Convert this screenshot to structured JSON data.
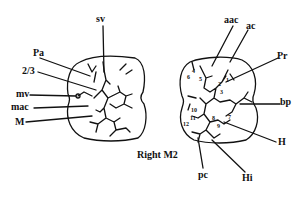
{
  "caption": "Right M2",
  "left_tooth": {
    "labels": {
      "sv": "sv",
      "Pa": "Pa",
      "two_thirds": "2/3",
      "mv": "mv",
      "mac": "mac",
      "M": "M"
    }
  },
  "right_tooth": {
    "labels": {
      "aac": "aac",
      "ac": "ac",
      "Pr": "Pr",
      "bp": "bp",
      "H": "H",
      "Hi": "Hi",
      "pc": "pc"
    },
    "numbers": [
      "1",
      "2",
      "3",
      "4",
      "5",
      "6",
      "7",
      "8",
      "9",
      "10",
      "11",
      "12"
    ]
  },
  "colors": {
    "ink": "#111111",
    "background": "#ffffff"
  }
}
